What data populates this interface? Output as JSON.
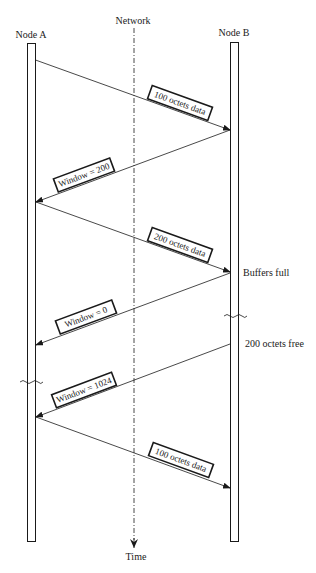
{
  "diagram": {
    "type": "sequence-diagram",
    "nodes": {
      "left": "Node A",
      "right": "Node B",
      "middle": "Network"
    },
    "time_label": "Time",
    "messages": [
      {
        "from": "Node A",
        "to": "Node B",
        "label": "100 octets data"
      },
      {
        "from": "Node B",
        "to": "Node A",
        "label": "Window = 200"
      },
      {
        "from": "Node A",
        "to": "Node B",
        "label": "200 octets data"
      },
      {
        "from": "Node B",
        "to": "Node A",
        "label": "Window = 0"
      },
      {
        "from": "Node B",
        "to": "Node A",
        "label": "Window = 1024"
      },
      {
        "from": "Node A",
        "to": "Node B",
        "label": "100 octets data"
      }
    ],
    "annotations": {
      "buffers_full": "Buffers full",
      "octets_free": "200 octets free"
    },
    "colors": {
      "line": "#1a1a1a",
      "background": "#ffffff"
    }
  }
}
